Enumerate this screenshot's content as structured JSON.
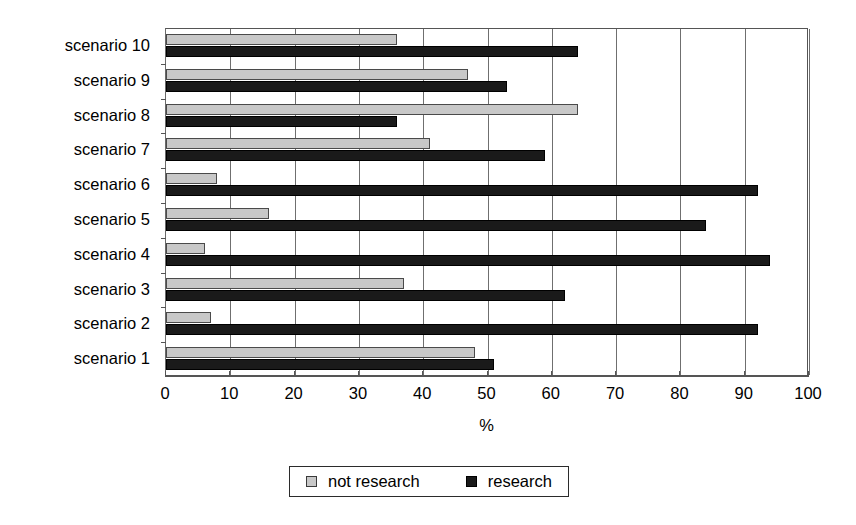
{
  "chart_data": {
    "type": "bar",
    "orientation": "horizontal",
    "title": "",
    "subtitle": "",
    "xlabel": "%",
    "ylabel": "",
    "xlim": [
      0,
      100
    ],
    "xticks": [
      0,
      10,
      20,
      30,
      40,
      50,
      60,
      70,
      80,
      90,
      100
    ],
    "xtick_labels": [
      "0",
      "10",
      "20",
      "30",
      "40",
      "50",
      "60",
      "70",
      "80",
      "90",
      "100"
    ],
    "grid": true,
    "grid_axis": "x",
    "legend_position": "bottom",
    "categories": [
      "scenario 10",
      "scenario 9",
      "scenario 8",
      "scenario 7",
      "scenario 6",
      "scenario 5",
      "scenario 4",
      "scenario 3",
      "scenario 2",
      "scenario 1"
    ],
    "series": [
      {
        "name": "not research",
        "color": "#c8c8c8",
        "values": [
          36,
          47,
          64,
          41,
          8,
          16,
          6,
          37,
          7,
          48
        ]
      },
      {
        "name": "research",
        "color": "#1a1a1a",
        "values": [
          64,
          53,
          36,
          59,
          92,
          84,
          94,
          62,
          92,
          51
        ]
      }
    ]
  },
  "legend": {
    "items": [
      {
        "label": "not research",
        "swatch": "legend-swatch-not-research"
      },
      {
        "label": "research",
        "swatch": "legend-swatch-research"
      }
    ]
  },
  "colors": {
    "not_research": "#c8c8c8",
    "research": "#1a1a1a",
    "axis": "#555555",
    "grid": "#6f6f6f",
    "background": "#ffffff"
  }
}
